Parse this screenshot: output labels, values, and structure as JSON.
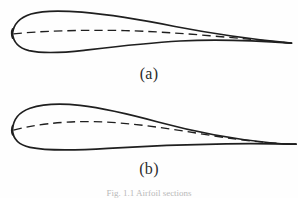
{
  "figure": {
    "type": "airfoil-cross-sections",
    "background_color": "#fefefe",
    "line_color": "#1f1f1f",
    "panels": [
      {
        "id": "a",
        "label": "(a)",
        "description": "nearly symmetric airfoil section with blunt rounded leading edge, sharp trailing edge, and a nearly straight mean camber line",
        "chord_start_x": 12,
        "chord_end_x": 292,
        "chord_y": 34,
        "max_thickness_y_top": 11,
        "max_thickness_y_bottom": 51,
        "camber": "low"
      },
      {
        "id": "b",
        "label": "(b)",
        "description": "cambered airfoil section with rounded leading edge, pronounced upper surface curvature and a long thin extended trailing edge",
        "chord_start_x": 12,
        "chord_end_x": 296,
        "chord_y": 130,
        "max_thickness_y_top": 105,
        "max_thickness_y_bottom": 148,
        "camber": "high"
      }
    ],
    "legend_note": "dashed line indicates mean camber line"
  },
  "caption": {
    "text": "Fig. 1.1  Airfoil sections"
  }
}
